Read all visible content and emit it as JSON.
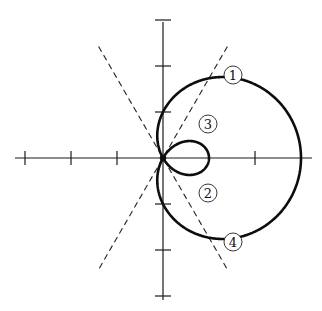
{
  "diagram": {
    "type": "polar-curve",
    "equation": "r = 1 + 2cos(θ)",
    "origin_px": [
      163,
      158
    ],
    "unit_px": 46,
    "x_axis": {
      "from_px": 15,
      "to_px": 312,
      "ticks": [
        -3,
        -2,
        -1,
        2
      ]
    },
    "y_axis": {
      "from_px": 22,
      "to_px": 300,
      "ticks": [
        -3,
        -2,
        -1,
        1,
        2,
        3
      ]
    },
    "dashed_lines": [
      {
        "name": "tangent-line-120deg",
        "angle_deg": 120
      },
      {
        "name": "tangent-line-60deg",
        "angle_deg": 60
      }
    ],
    "dashed_line_extent_units": 2.8,
    "labels": [
      {
        "text": "1",
        "glyph": "①",
        "x": 233,
        "y": 75
      },
      {
        "text": "3",
        "glyph": "③",
        "x": 208,
        "y": 124
      },
      {
        "text": "2",
        "glyph": "②",
        "x": 208,
        "y": 193
      },
      {
        "text": "4",
        "glyph": "④",
        "x": 233,
        "y": 242
      }
    ],
    "colors": {
      "curve": "#0d0d0d",
      "axis": "#1a1a1a",
      "background": "#ffffff"
    }
  }
}
